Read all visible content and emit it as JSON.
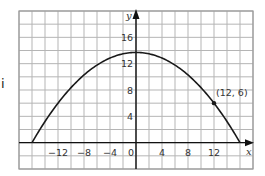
{
  "side_label": "i",
  "chart_data": {
    "type": "line",
    "title": "",
    "xlabel": "x",
    "ylabel": "y",
    "xlim": [
      -18,
      18
    ],
    "ylim": [
      -4,
      20
    ],
    "grid": true,
    "grid_step": 2,
    "x_ticks": [
      -12,
      -8,
      -4,
      0,
      4,
      8,
      12
    ],
    "x_tick_labels": [
      "−12",
      "−8",
      "−4",
      "0",
      "4",
      "8",
      "12"
    ],
    "y_ticks": [
      4,
      8,
      12,
      16
    ],
    "y_tick_labels": [
      "4",
      "8",
      "12",
      "16"
    ],
    "series": [
      {
        "name": "parabola",
        "equation": "y = 13.71 - 0.0536 x^2",
        "x": [
          -16,
          -14,
          -12,
          -10,
          -8,
          -6,
          -4,
          -2,
          0,
          2,
          4,
          6,
          8,
          10,
          12,
          14,
          16
        ],
        "y": [
          0,
          3.21,
          6,
          8.36,
          10.29,
          11.79,
          12.86,
          13.5,
          13.71,
          13.5,
          12.86,
          11.79,
          10.29,
          8.36,
          6,
          3.21,
          0
        ]
      }
    ],
    "annotations": [
      {
        "x": 12,
        "y": 6,
        "label": "(12, 6)",
        "marker": "point"
      }
    ],
    "colors": {
      "grid": "#b5b5b5",
      "axis": "#111111",
      "curve": "#1a1a1a",
      "border": "#9a9a9a"
    }
  }
}
